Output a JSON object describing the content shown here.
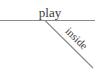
{
  "diagram": {
    "type": "sentence-diagram",
    "main_line": {
      "word": "play"
    },
    "modifiers": [
      {
        "word": "inside",
        "attached_to": "play",
        "line": "diagonal"
      }
    ],
    "colors": {
      "line": "#8a8a8a",
      "text": "#3a3a3a",
      "background": "#ffffff"
    }
  }
}
